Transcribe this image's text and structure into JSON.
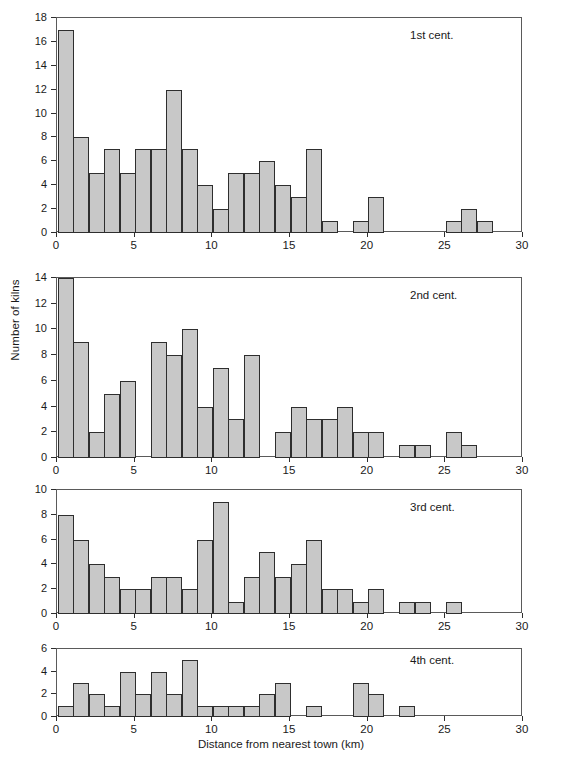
{
  "figure": {
    "xlabel": "Distance from nearest town (km)",
    "ylabel": "Number of kilns",
    "x_ticks": [
      "0",
      "5",
      "10",
      "15",
      "20",
      "25",
      "30"
    ]
  },
  "chart_data": {
    "type": "bar",
    "title": "",
    "xlabel": "Distance from nearest town (km)",
    "ylabel": "Number of kilns",
    "xlim": [
      0,
      30
    ],
    "bin_width": 1,
    "grid": false,
    "legend": "none",
    "panels": [
      {
        "label": "1st cent.",
        "ylim": [
          0,
          18
        ],
        "yticks": [
          0,
          2,
          4,
          6,
          8,
          10,
          12,
          14,
          16,
          18
        ],
        "bin_starts": [
          0,
          1,
          2,
          3,
          4,
          5,
          6,
          7,
          8,
          9,
          10,
          11,
          12,
          13,
          14,
          15,
          16,
          17,
          18,
          19,
          20,
          21,
          22,
          23,
          24,
          25,
          26,
          27,
          28,
          29
        ],
        "values": [
          17,
          8,
          5,
          7,
          5,
          7,
          7,
          12,
          7,
          4,
          2,
          5,
          5,
          6,
          4,
          3,
          7,
          1,
          0,
          1,
          3,
          0,
          0,
          0,
          0,
          1,
          2,
          1,
          0,
          0
        ]
      },
      {
        "label": "2nd cent.",
        "ylim": [
          0,
          14
        ],
        "yticks": [
          0,
          2,
          4,
          6,
          8,
          10,
          12,
          14
        ],
        "bin_starts": [
          0,
          1,
          2,
          3,
          4,
          5,
          6,
          7,
          8,
          9,
          10,
          11,
          12,
          13,
          14,
          15,
          16,
          17,
          18,
          19,
          20,
          21,
          22,
          23,
          24,
          25,
          26,
          27,
          28,
          29
        ],
        "values": [
          14,
          9,
          2,
          5,
          6,
          0,
          9,
          8,
          10,
          4,
          7,
          3,
          8,
          0,
          2,
          4,
          3,
          3,
          4,
          2,
          2,
          0,
          1,
          1,
          0,
          2,
          1,
          0,
          0,
          0
        ]
      },
      {
        "label": "3rd cent.",
        "ylim": [
          0,
          10
        ],
        "yticks": [
          0,
          2,
          4,
          6,
          8,
          10
        ],
        "bin_starts": [
          0,
          1,
          2,
          3,
          4,
          5,
          6,
          7,
          8,
          9,
          10,
          11,
          12,
          13,
          14,
          15,
          16,
          17,
          18,
          19,
          20,
          21,
          22,
          23,
          24,
          25,
          26,
          27,
          28,
          29
        ],
        "values": [
          8,
          6,
          4,
          3,
          2,
          2,
          3,
          3,
          2,
          6,
          9,
          1,
          3,
          5,
          3,
          4,
          6,
          2,
          2,
          1,
          2,
          0,
          1,
          1,
          0,
          1,
          0,
          0,
          0,
          0
        ]
      },
      {
        "label": "4th cent.",
        "ylim": [
          0,
          6
        ],
        "yticks": [
          0,
          2,
          4,
          6
        ],
        "bin_starts": [
          0,
          1,
          2,
          3,
          4,
          5,
          6,
          7,
          8,
          9,
          10,
          11,
          12,
          13,
          14,
          15,
          16,
          17,
          18,
          19,
          20,
          21,
          22,
          23,
          24,
          25,
          26,
          27,
          28,
          29
        ],
        "values": [
          1,
          3,
          2,
          1,
          4,
          2,
          4,
          2,
          5,
          1,
          1,
          1,
          1,
          2,
          3,
          0,
          1,
          0,
          0,
          3,
          2,
          0,
          1,
          0,
          0,
          0,
          0,
          0,
          0,
          0
        ]
      }
    ],
    "colors": {
      "bar_fill": "#c8c8c8",
      "bar_edge": "#2e2e2e",
      "axis": "#5a5a5a",
      "text": "#1a1a1a"
    }
  }
}
